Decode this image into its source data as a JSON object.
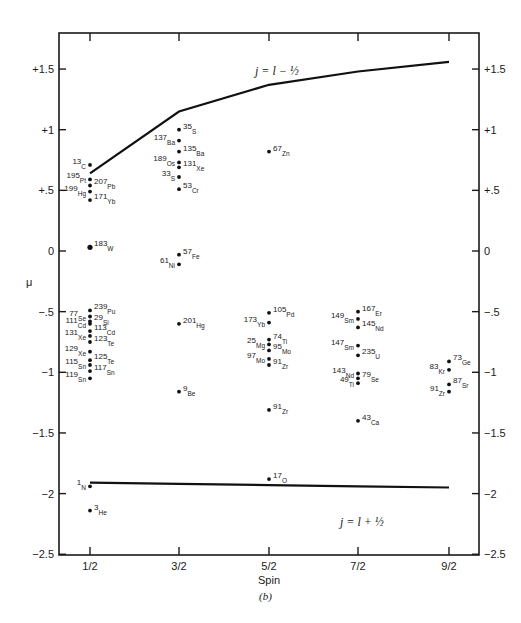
{
  "chart_data": {
    "type": "scatter",
    "title": "",
    "caption": "(b)",
    "xlabel": "Spin",
    "ylabel": "μ",
    "categories": [
      "1/2",
      "3/2",
      "5/2",
      "7/2",
      "9/2"
    ],
    "ylim": [
      -2.5,
      1.8
    ],
    "yticks": [
      {
        "value": 1.5,
        "label": "+1.5"
      },
      {
        "value": 1,
        "label": "+1"
      },
      {
        "value": 0.5,
        "label": "+.5"
      },
      {
        "value": 0,
        "label": "0"
      },
      {
        "value": -0.5,
        "label": "−.5"
      },
      {
        "value": -1,
        "label": "−1"
      },
      {
        "value": -1.5,
        "label": "−1.5"
      },
      {
        "value": -2,
        "label": "−2"
      },
      {
        "value": -2.5,
        "label": "−2.5"
      }
    ],
    "grid": false,
    "legend": null,
    "series": [
      {
        "name": "Schmidt line j = l − 1/2",
        "kind": "line",
        "label": "j = l − ½",
        "points": [
          [
            "1/2",
            0.64
          ],
          [
            "3/2",
            1.15
          ],
          [
            "5/2",
            1.37
          ],
          [
            "7/2",
            1.48
          ],
          [
            "9/2",
            1.56
          ]
        ]
      },
      {
        "name": "Schmidt line j = l + 1/2",
        "kind": "line",
        "label": "j = l + ½",
        "points": [
          [
            "1/2",
            -1.91
          ],
          [
            "3/2",
            -1.92
          ],
          [
            "5/2",
            -1.93
          ],
          [
            "7/2",
            -1.94
          ],
          [
            "9/2",
            -1.95
          ]
        ]
      },
      {
        "name": "Nuclei",
        "kind": "scatter",
        "points": [
          {
            "spin": "1/2",
            "mass": "13",
            "el": "C",
            "mu": 0.71,
            "side": "left"
          },
          {
            "spin": "1/2",
            "mass": "195",
            "el": "Pt",
            "mu": 0.59,
            "side": "left"
          },
          {
            "spin": "1/2",
            "mass": "207",
            "el": "Pb",
            "mu": 0.54,
            "side": "right"
          },
          {
            "spin": "1/2",
            "mass": "199",
            "el": "Hg",
            "mu": 0.49,
            "side": "left"
          },
          {
            "spin": "1/2",
            "mass": "171",
            "el": "Yb",
            "mu": 0.42,
            "side": "right"
          },
          {
            "spin": "1/2",
            "mass": "183",
            "el": "W",
            "mu": 0.03,
            "side": "right"
          },
          {
            "spin": "1/2",
            "mass": "239",
            "el": "Pu",
            "mu": -0.49,
            "side": "right"
          },
          {
            "spin": "1/2",
            "mass": "77",
            "el": "Se",
            "mu": -0.54,
            "side": "left"
          },
          {
            "spin": "1/2",
            "mass": "29",
            "el": "Si",
            "mu": -0.58,
            "side": "right"
          },
          {
            "spin": "1/2",
            "mass": "111",
            "el": "Cd",
            "mu": -0.6,
            "side": "left"
          },
          {
            "spin": "1/2",
            "mass": "113",
            "el": "Cd",
            "mu": -0.66,
            "side": "right"
          },
          {
            "spin": "1/2",
            "mass": "131",
            "el": "Xe",
            "mu": -0.7,
            "side": "left"
          },
          {
            "spin": "1/2",
            "mass": "123",
            "el": "Te",
            "mu": -0.75,
            "side": "right"
          },
          {
            "spin": "1/2",
            "mass": "129",
            "el": "Xe",
            "mu": -0.83,
            "side": "left"
          },
          {
            "spin": "1/2",
            "mass": "125",
            "el": "Te",
            "mu": -0.9,
            "side": "right"
          },
          {
            "spin": "1/2",
            "mass": "115",
            "el": "Sn",
            "mu": -0.94,
            "side": "left"
          },
          {
            "spin": "1/2",
            "mass": "117",
            "el": "Sn",
            "mu": -0.99,
            "side": "right"
          },
          {
            "spin": "1/2",
            "mass": "119",
            "el": "Sn",
            "mu": -1.05,
            "side": "left"
          },
          {
            "spin": "1/2",
            "mass": "1",
            "el": "N",
            "mu": -1.94,
            "side": "left"
          },
          {
            "spin": "1/2",
            "mass": "3",
            "el": "He",
            "mu": -2.14,
            "side": "right"
          },
          {
            "spin": "3/2",
            "mass": "35",
            "el": "S",
            "mu": 1.0,
            "side": "right"
          },
          {
            "spin": "3/2",
            "mass": "137",
            "el": "Ba",
            "mu": 0.91,
            "side": "left"
          },
          {
            "spin": "3/2",
            "mass": "135",
            "el": "Ba",
            "mu": 0.82,
            "side": "right"
          },
          {
            "spin": "3/2",
            "mass": "189",
            "el": "Os",
            "mu": 0.73,
            "side": "left"
          },
          {
            "spin": "3/2",
            "mass": "131",
            "el": "Xe",
            "mu": 0.69,
            "side": "right"
          },
          {
            "spin": "3/2",
            "mass": "33",
            "el": "S",
            "mu": 0.61,
            "side": "left"
          },
          {
            "spin": "3/2",
            "mass": "53",
            "el": "Cr",
            "mu": 0.51,
            "side": "right"
          },
          {
            "spin": "3/2",
            "mass": "57",
            "el": "Fe",
            "mu": -0.03,
            "side": "right"
          },
          {
            "spin": "3/2",
            "mass": "61",
            "el": "Ni",
            "mu": -0.11,
            "side": "left"
          },
          {
            "spin": "3/2",
            "mass": "201",
            "el": "Hg",
            "mu": -0.6,
            "side": "right"
          },
          {
            "spin": "3/2",
            "mass": "9",
            "el": "Be",
            "mu": -1.16,
            "side": "right"
          },
          {
            "spin": "5/2",
            "mass": "67",
            "el": "Zn",
            "mu": 0.82,
            "side": "right"
          },
          {
            "spin": "5/2",
            "mass": "105",
            "el": "Pd",
            "mu": -0.51,
            "side": "right"
          },
          {
            "spin": "5/2",
            "mass": "173",
            "el": "Yb",
            "mu": -0.59,
            "side": "left"
          },
          {
            "spin": "5/2",
            "mass": "74",
            "el": "Ti",
            "mu": -0.73,
            "side": "right"
          },
          {
            "spin": "5/2",
            "mass": "25",
            "el": "Mg",
            "mu": -0.77,
            "side": "left"
          },
          {
            "spin": "5/2",
            "mass": "95",
            "el": "Mo",
            "mu": -0.82,
            "side": "right"
          },
          {
            "spin": "5/2",
            "mass": "97",
            "el": "Mo",
            "mu": -0.89,
            "side": "left"
          },
          {
            "spin": "5/2",
            "mass": "91",
            "el": "Zr",
            "mu": -0.94,
            "side": "right"
          },
          {
            "spin": "5/2",
            "mass": "91",
            "el": "Zr",
            "mu": -1.31,
            "side": "right"
          },
          {
            "spin": "5/2",
            "mass": "17",
            "el": "O",
            "mu": -1.88,
            "side": "right"
          },
          {
            "spin": "7/2",
            "mass": "167",
            "el": "Er",
            "mu": -0.5,
            "side": "right"
          },
          {
            "spin": "7/2",
            "mass": "149",
            "el": "Sm",
            "mu": -0.56,
            "side": "left"
          },
          {
            "spin": "7/2",
            "mass": "145",
            "el": "Nd",
            "mu": -0.63,
            "side": "right"
          },
          {
            "spin": "7/2",
            "mass": "147",
            "el": "Sm",
            "mu": -0.78,
            "side": "left"
          },
          {
            "spin": "7/2",
            "mass": "235",
            "el": "U",
            "mu": -0.86,
            "side": "right"
          },
          {
            "spin": "7/2",
            "mass": "143",
            "el": "Nd",
            "mu": -1.01,
            "side": "left"
          },
          {
            "spin": "7/2",
            "mass": "79",
            "el": "Se",
            "mu": -1.05,
            "side": "right"
          },
          {
            "spin": "7/2",
            "mass": "49",
            "el": "Ti",
            "mu": -1.09,
            "side": "left"
          },
          {
            "spin": "7/2",
            "mass": "43",
            "el": "Ca",
            "mu": -1.4,
            "side": "right"
          },
          {
            "spin": "9/2",
            "mass": "73",
            "el": "Ge",
            "mu": -0.91,
            "side": "right"
          },
          {
            "spin": "9/2",
            "mass": "83",
            "el": "Kr",
            "mu": -0.98,
            "side": "left"
          },
          {
            "spin": "9/2",
            "mass": "87",
            "el": "Sr",
            "mu": -1.1,
            "side": "right"
          },
          {
            "spin": "9/2",
            "mass": "91",
            "el": "Zr",
            "mu": -1.16,
            "side": "left"
          }
        ]
      }
    ]
  },
  "labels": {
    "upper_curve": "j = l − ½",
    "lower_curve": "j = l + ½",
    "xlabel": "Spin",
    "ylabel": "μ",
    "caption": "(b)"
  }
}
